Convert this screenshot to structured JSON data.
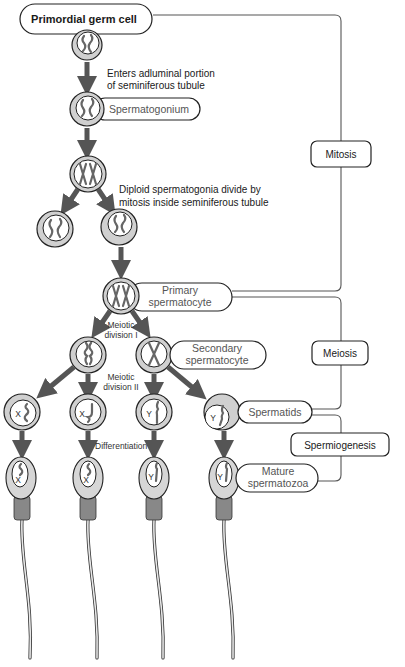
{
  "diagram": {
    "nodes": {
      "primordial": "Primordial germ cell",
      "enters_line1": "Enters adluminal portion",
      "enters_line2": "of seminiferous tubule",
      "spermatogonium": "Spermatogonium",
      "diploid_line1": "Diploid spermatogonia divide by",
      "diploid_line2": "mitosis inside seminiferous tubule",
      "primary_line1": "Primary",
      "primary_line2": "spermatocyte",
      "meiotic1_line1": "Meiotic",
      "meiotic1_line2": "division I",
      "secondary_line1": "Secondary",
      "secondary_line2": "spermatocyte",
      "meiotic2_line1": "Meiotic",
      "meiotic2_line2": "division II",
      "spermatids": "Spermatids",
      "differentiation": "Differentiation",
      "mature_line1": "Mature",
      "mature_line2": "spermatozoa"
    },
    "phases": {
      "mitosis": "Mitosis",
      "meiosis": "Meiosis",
      "spermiogenesis": "Spermiogenesis"
    },
    "chromosome_labels": {
      "x": "X",
      "y": "Y"
    },
    "spermatid_chromosomes": [
      "X",
      "X",
      "Y",
      "Y"
    ],
    "sperm_chromosomes": [
      "X",
      "X",
      "Y",
      "Y"
    ]
  }
}
